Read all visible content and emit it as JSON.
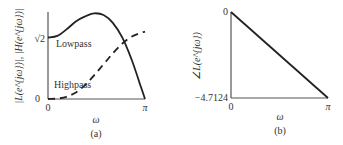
{
  "chart_data": [
    {
      "type": "line",
      "panel_label": "(a)",
      "xlabel": "ω",
      "ylabel": "|L(e^{jω})|, |H(e^{jω})|",
      "xlim": [
        0,
        3.1416
      ],
      "ylim": [
        0,
        2.0
      ],
      "x_tick_labels": [
        "0",
        "π"
      ],
      "y_tick_labels": [
        "0",
        "√2"
      ],
      "y_ticks": [
        0,
        1.4142
      ],
      "series": [
        {
          "name": "Lowpass",
          "style": "solid",
          "x": [
            0,
            0.3,
            0.6,
            0.9,
            1.2,
            1.5,
            1.8,
            2.1,
            2.4,
            2.7,
            3.0,
            3.1416
          ],
          "y": [
            1.414,
            1.45,
            1.6,
            1.78,
            1.9,
            1.97,
            1.93,
            1.75,
            1.42,
            0.92,
            0.3,
            0.0
          ]
        },
        {
          "name": "Highpass",
          "style": "dashed",
          "x": [
            0,
            0.3,
            0.6,
            0.9,
            1.2,
            1.5,
            1.8,
            2.1,
            2.4,
            2.7,
            3.0,
            3.1416
          ],
          "y": [
            0.0,
            0.01,
            0.05,
            0.15,
            0.32,
            0.55,
            0.8,
            1.05,
            1.27,
            1.43,
            1.52,
            1.55
          ]
        }
      ],
      "annotations": [
        "Lowpass",
        "Highpass"
      ]
    },
    {
      "type": "line",
      "panel_label": "(b)",
      "xlabel": "ω",
      "ylabel": "∠L(e^{jω})",
      "xlim": [
        0,
        3.1416
      ],
      "ylim": [
        -4.7124,
        0
      ],
      "x_tick_labels": [
        "0",
        "π"
      ],
      "y_tick_labels": [
        "0",
        "−4.7124"
      ],
      "series": [
        {
          "name": "Phase",
          "style": "solid",
          "x": [
            0,
            3.1416
          ],
          "y": [
            0,
            -4.7124
          ]
        }
      ]
    }
  ]
}
